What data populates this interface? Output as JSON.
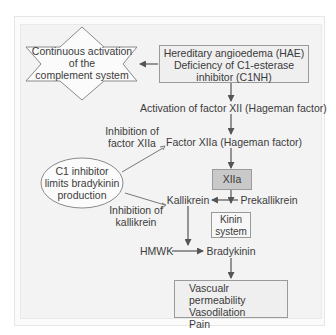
{
  "diagram": {
    "nodes": {
      "complement": {
        "shape": "star",
        "lines": [
          "Continuous activation",
          "of the",
          "complement system"
        ]
      },
      "hae": {
        "shape": "box",
        "lines": [
          "Hereditary angioedema (HAE)",
          "Deficiency of C1-esterase",
          "inhibitor (C1NH)"
        ]
      },
      "activation_xii": {
        "text": "Activation of factor XII (Hageman factor)"
      },
      "factor_xiia": {
        "text": "Factor XIIa (Hageman factor)"
      },
      "xiia_box": {
        "shape": "box",
        "text": "XIIa",
        "fill": "#c9c9c9"
      },
      "prekallikrein": {
        "text": "Prekallikrein"
      },
      "kallikrein": {
        "text": "Kallikrein"
      },
      "kinin": {
        "shape": "box",
        "lines": [
          "Kinin",
          "system"
        ]
      },
      "hmwk": {
        "text": "HMWK"
      },
      "bradykinin": {
        "text": "Bradykinin"
      },
      "effects": {
        "shape": "box",
        "indicator": "up-arrow",
        "lines": [
          "Vascualr permeability",
          "Vasodilation",
          "Pain"
        ]
      },
      "c1_inhibitor": {
        "shape": "ellipse",
        "lines": [
          "C1 inhibitor",
          "limits bradykinin",
          "production"
        ]
      },
      "inhibit_xiia": {
        "lines": [
          "Inhibition of",
          "factor XIIa"
        ]
      },
      "inhibit_kallikrein": {
        "lines": [
          "Inhibition of",
          "kallikrein"
        ]
      }
    },
    "edges": [
      {
        "from": "hae",
        "to": "complement",
        "type": "arrow"
      },
      {
        "from": "hae",
        "to": "activation_xii",
        "type": "arrow"
      },
      {
        "from": "activation_xii",
        "to": "factor_xiia",
        "type": "arrow"
      },
      {
        "from": "factor_xiia",
        "to": "xiia_box",
        "type": "arrow"
      },
      {
        "from": "xiia_box",
        "to": "prekallikrein",
        "type": "arrow"
      },
      {
        "from": "prekallikrein",
        "to": "kallikrein",
        "type": "arrow"
      },
      {
        "from": "kallikrein",
        "to": "bradykinin",
        "type": "arrow"
      },
      {
        "from": "hmwk",
        "to": "bradykinin",
        "type": "arrow"
      },
      {
        "from": "bradykinin",
        "to": "effects",
        "type": "arrow"
      },
      {
        "from": "c1_inhibitor",
        "to": "factor_xiia",
        "type": "inhibit"
      },
      {
        "from": "c1_inhibitor",
        "to": "kallikrein",
        "type": "inhibit"
      }
    ],
    "colors": {
      "line": "#555555",
      "box_border": "#9a9a9a",
      "xiia_fill": "#c9c9c9",
      "panel": "#f3f3f3"
    }
  }
}
